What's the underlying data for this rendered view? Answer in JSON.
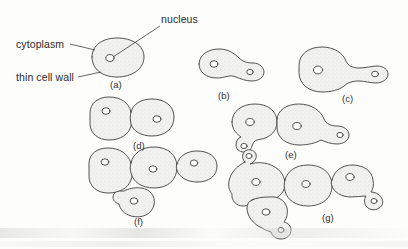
{
  "figure": {
    "title_region": "yeast-cell-budding-stages",
    "background_color": "#fdfdfc",
    "ink_color": "#3a3a3a",
    "cytoplasm_fill": "#efefef",
    "nucleus_fill": "#ffffff"
  },
  "callouts": [
    {
      "id": "nucleus",
      "text": "nucleus"
    },
    {
      "id": "cytoplasm",
      "text": "cytoplasm"
    },
    {
      "id": "thin-cell-wall",
      "text": "thin cell wall"
    }
  ],
  "panels": [
    {
      "id": "a",
      "label": "(a)",
      "description": "single oval cell with one nucleus"
    },
    {
      "id": "b",
      "label": "(b)",
      "description": "cell with small bud emerging at right"
    },
    {
      "id": "c",
      "label": "(c)",
      "description": "round cell with elongated neck and bud"
    },
    {
      "id": "d",
      "label": "(d)",
      "description": "two equal daughter cells joined"
    },
    {
      "id": "e",
      "label": "(e)",
      "description": "two cells each carrying a small bud"
    },
    {
      "id": "f",
      "label": "(f)",
      "description": "chain of three cells with one bud below"
    },
    {
      "id": "g",
      "label": "(g)",
      "description": "branched cluster of cells with multiple buds"
    }
  ]
}
